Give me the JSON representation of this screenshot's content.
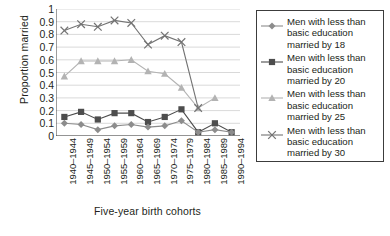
{
  "chart_data": {
    "type": "line",
    "title": "",
    "xlabel": "Five-year birth cohorts",
    "ylabel": "Proportion married",
    "ylim": [
      0,
      1
    ],
    "ytick_labels": [
      "0",
      "0.1",
      "0.2",
      "0.3",
      "0.4",
      "0.5",
      "0.6",
      "0.7",
      "0.8",
      "0.9",
      "1"
    ],
    "ytick_values": [
      0,
      0.1,
      0.2,
      0.3,
      0.4,
      0.5,
      0.6,
      0.7,
      0.8,
      0.9,
      1
    ],
    "grid": true,
    "legend_position": "right",
    "categories": [
      "1940–1944",
      "1945–1949",
      "1950–1954",
      "1955–1959",
      "1960–1964",
      "1965–1969",
      "1970–1974",
      "1975–1979",
      "1980–1984",
      "1985–1989",
      "1990–1994"
    ],
    "series": [
      {
        "name": "Men with less than basic education married by 18",
        "marker": "diamond",
        "color": "#8c8c8c",
        "values": [
          0.1,
          0.09,
          0.05,
          0.08,
          0.09,
          0.07,
          0.08,
          0.12,
          0.03,
          0.05,
          0.03
        ]
      },
      {
        "name": "Men with less than basic education married by 20",
        "marker": "square",
        "color": "#4d4d4d",
        "values": [
          0.15,
          0.19,
          0.13,
          0.18,
          0.18,
          0.11,
          0.15,
          0.21,
          0.03,
          0.1,
          0.03
        ]
      },
      {
        "name": "Men with less than basic education married by 25",
        "marker": "triangle",
        "color": "#b3b3b3",
        "values": [
          0.47,
          0.59,
          0.59,
          0.59,
          0.6,
          0.51,
          0.49,
          0.38,
          0.22,
          0.3,
          null
        ]
      },
      {
        "name": "Men with less than basic education married by 30",
        "marker": "cross",
        "color": "#737373",
        "values": [
          0.83,
          0.88,
          0.86,
          0.91,
          0.89,
          0.72,
          0.79,
          0.74,
          0.22,
          null,
          null
        ]
      }
    ]
  },
  "legend": {
    "entries": [
      "Men with less than\nbasic education\nmarried by 18",
      "Men with less than\nbasic education\nmarried by 20",
      "Men with less than\nbasic education\nmarried by 25",
      "Men with less than\nbasic education\nmarried by 30"
    ]
  }
}
